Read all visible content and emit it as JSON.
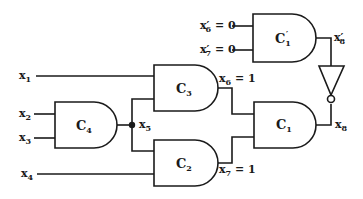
{
  "diagram": {
    "type": "logic-circuit",
    "colors": {
      "line": "#1a1a1a",
      "background": "#ffffff"
    },
    "gates": [
      {
        "id": "C1p",
        "label": "C",
        "sub": "1",
        "prime": "′",
        "type": "AND"
      },
      {
        "id": "C3",
        "label": "C",
        "sub": "3",
        "type": "AND"
      },
      {
        "id": "C4",
        "label": "C",
        "sub": "4",
        "type": "AND"
      },
      {
        "id": "C2",
        "label": "C",
        "sub": "2",
        "type": "AND"
      },
      {
        "id": "C1",
        "label": "C",
        "sub": "1",
        "type": "AND"
      },
      {
        "id": "INV",
        "label": "",
        "type": "NOT"
      }
    ],
    "signals": {
      "x1": {
        "name": "x",
        "sub": "1"
      },
      "x2": {
        "name": "x",
        "sub": "2"
      },
      "x3": {
        "name": "x",
        "sub": "3"
      },
      "x4": {
        "name": "x",
        "sub": "4"
      },
      "x5": {
        "name": "x",
        "sub": "5"
      },
      "x6": {
        "name": "x",
        "sub": "6",
        "value": " = 1"
      },
      "x7": {
        "name": "x",
        "sub": "7",
        "value": " = 1"
      },
      "x8": {
        "name": "x",
        "sub": "8"
      },
      "x6p": {
        "name": "x′",
        "sub": "6",
        "value": " = 0"
      },
      "x7p": {
        "name": "x′",
        "sub": "7",
        "value": " = 0"
      },
      "x8p": {
        "name": "x′",
        "sub": "8"
      }
    }
  }
}
